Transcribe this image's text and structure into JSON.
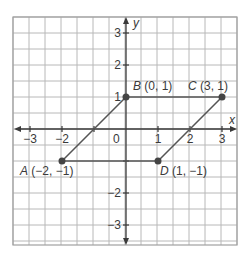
{
  "diagram": {
    "type": "coordinate-plane",
    "colors": {
      "grid": "#b8b8b8",
      "axis": "#3a3a3a",
      "shape": "#555555",
      "point": "#444444",
      "text": "#3a3a3a",
      "background": "#ffffff"
    },
    "axes": {
      "x_label": "x",
      "y_label": "y",
      "x_range": [
        -3.5,
        3.5
      ],
      "y_range": [
        -3.5,
        3.5
      ],
      "x_ticks": [
        {
          "value": -3,
          "label": "−3"
        },
        {
          "value": -2,
          "label": "−2"
        },
        {
          "value": 1,
          "label": "1"
        },
        {
          "value": 2,
          "label": "2"
        },
        {
          "value": 3,
          "label": "3"
        }
      ],
      "y_ticks": [
        {
          "value": 3,
          "label": "3"
        },
        {
          "value": 2,
          "label": "2"
        },
        {
          "value": 1,
          "label": "1"
        },
        {
          "value": -2,
          "label": "−2"
        },
        {
          "value": -3,
          "label": "−3"
        }
      ],
      "origin_label": "0"
    },
    "points": [
      {
        "name": "A",
        "coords": "(−2, −1)",
        "x": -2,
        "y": -1
      },
      {
        "name": "B",
        "coords": "(0, 1)",
        "x": 0,
        "y": 1
      },
      {
        "name": "C",
        "coords": "(3, 1)",
        "x": 3,
        "y": 1
      },
      {
        "name": "D",
        "coords": "(1, −1)",
        "x": 1,
        "y": -1
      }
    ],
    "polygon": [
      "A",
      "B",
      "C",
      "D"
    ]
  }
}
